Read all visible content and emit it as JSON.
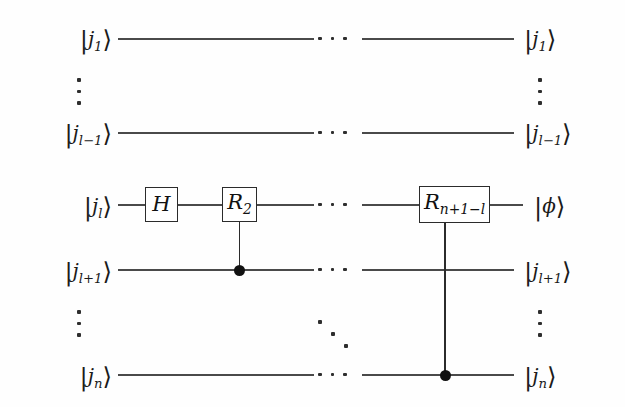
{
  "diagram": {
    "type": "quantum-circuit",
    "background_color": "#fefefe",
    "line_color": "#4a4a4a",
    "gate_border_color": "#2b2b2b",
    "dot_color": "#111111",
    "wire_count": 5
  },
  "inputs": [
    {
      "base": "j",
      "sub": "1",
      "text": "|j1⟩"
    },
    {
      "base": "j",
      "sub": "l−1",
      "text": "|jl-1⟩"
    },
    {
      "base": "j",
      "sub": "l",
      "text": "|jl⟩"
    },
    {
      "base": "j",
      "sub": "l+1",
      "text": "|jl+1⟩"
    },
    {
      "base": "j",
      "sub": "n",
      "text": "|jn⟩"
    }
  ],
  "outputs": [
    {
      "base": "j",
      "sub": "1",
      "text": "|j1⟩"
    },
    {
      "base": "j",
      "sub": "l−1",
      "text": "|jl-1⟩"
    },
    {
      "base": "ϕ",
      "sub": "",
      "text": "|ϕ⟩"
    },
    {
      "base": "j",
      "sub": "l+1",
      "text": "|jl+1⟩"
    },
    {
      "base": "j",
      "sub": "n",
      "text": "|jn⟩"
    }
  ],
  "gates": [
    {
      "name": "hadamard",
      "base": "H",
      "sub": "",
      "label": "H",
      "wire": 3
    },
    {
      "name": "phase-rotation-2",
      "base": "R",
      "sub": "2",
      "label": "R2",
      "wire": 3,
      "control_wire": 4
    },
    {
      "name": "phase-rotation-n",
      "base": "R",
      "sub": "n+1−l",
      "label": "Rn+1-l",
      "wire": 3,
      "control_wire": 5
    }
  ],
  "ellipses": {
    "horizontal_label": "⋯",
    "vertical_label": "⋮",
    "diagonal_label": "⋱",
    "horizontal_count": 5,
    "vertical_left_count": 2,
    "vertical_right_count": 2,
    "diagonal_count": 1
  }
}
